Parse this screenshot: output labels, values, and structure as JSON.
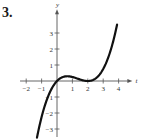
{
  "problem_number": "3.",
  "chart_data": {
    "type": "line",
    "title": "",
    "xlabel": "t",
    "ylabel": "y",
    "x_ticks": [
      -2,
      -1,
      1,
      2,
      3,
      4
    ],
    "y_ticks": [
      -3,
      -2,
      -1,
      1,
      2,
      3
    ],
    "x_tick_labels": [
      "−2",
      "−1",
      "1",
      "2",
      "3",
      "4"
    ],
    "y_tick_labels": [
      "−3",
      "−2",
      "−1",
      "1",
      "2",
      "3"
    ],
    "xlim": [
      -2.4,
      4.7
    ],
    "ylim": [
      -3.5,
      4.3
    ],
    "grid": false,
    "legend": null,
    "series": [
      {
        "name": "f(t)",
        "x": [
          -1.3,
          -1.0,
          -0.5,
          0,
          0.25,
          0.5,
          0.67,
          1.0,
          1.5,
          2.0,
          2.5,
          3.0,
          3.5,
          3.9
        ],
        "values": [
          -3.54,
          -2.25,
          -0.78,
          0,
          0.19,
          0.28,
          0.3,
          0.25,
          0.09,
          0,
          0.16,
          0.75,
          1.97,
          3.52
        ]
      }
    ],
    "annotations": {
      "local_max": [
        0.67,
        0.3
      ],
      "local_min": [
        2,
        0
      ]
    }
  }
}
